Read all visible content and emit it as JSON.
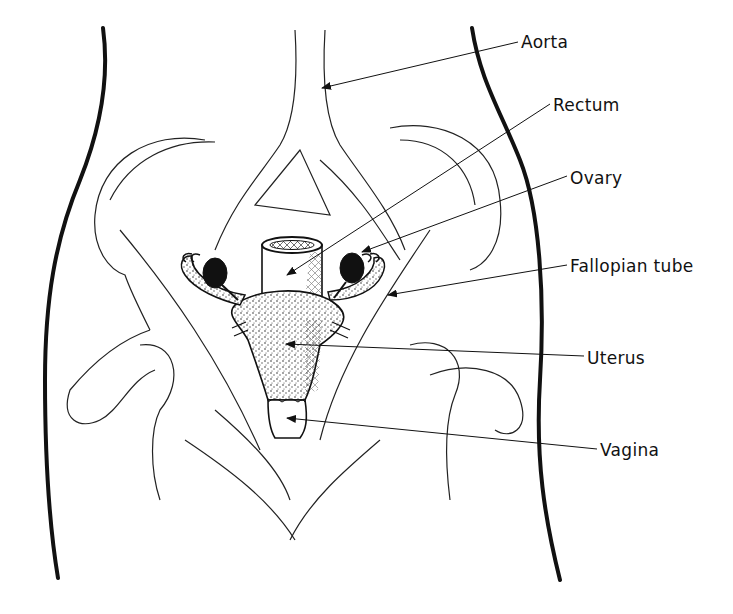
{
  "diagram": {
    "labels": [
      {
        "id": "aorta",
        "text": "Aorta",
        "x": 521,
        "y": 33,
        "target": [
          322,
          88
        ]
      },
      {
        "id": "rectum",
        "text": "Rectum",
        "x": 553,
        "y": 96,
        "target": [
          285,
          278
        ]
      },
      {
        "id": "ovary",
        "text": "Ovary",
        "x": 570,
        "y": 169,
        "target": [
          360,
          252
        ]
      },
      {
        "id": "fallopian-tube",
        "text": "Fallopian tube",
        "x": 570,
        "y": 257,
        "target": [
          388,
          295
        ]
      },
      {
        "id": "uterus",
        "text": "Uterus",
        "x": 587,
        "y": 349,
        "target": [
          283,
          344
        ]
      },
      {
        "id": "vagina",
        "text": "Vagina",
        "x": 600,
        "y": 441,
        "target": [
          285,
          418
        ]
      }
    ]
  }
}
